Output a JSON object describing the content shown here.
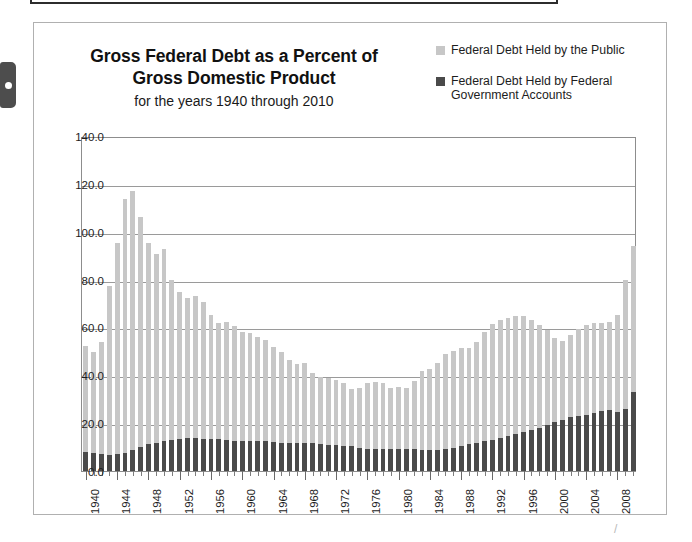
{
  "card": {
    "title_line1": "Gross  Federal Debt as a Percent of",
    "title_line2": "Gross Domestic Product",
    "subtitle": "for the years 1940 through 2010"
  },
  "legend": {
    "position": "top-right",
    "items": [
      {
        "label": "Federal Debt Held by the Public",
        "color": "#c7c7c7"
      },
      {
        "label": "Federal Debt Held by Federal Government Accounts",
        "color": "#4a4a4a"
      }
    ]
  },
  "colors": {
    "public": "#c7c7c7",
    "intragov": "#4a4a4a",
    "gridline": "#9a9a9a",
    "frame": "#8d8d8d",
    "card_border": "#b0b0b0",
    "text": "#1d1d1d"
  },
  "chart_data": {
    "type": "bar",
    "stacked": true,
    "title": "Gross  Federal Debt as a Percent of Gross Domestic Product",
    "subtitle": "for the years 1940 through 2010",
    "xlabel": "",
    "ylabel": "",
    "ylim": [
      0.0,
      140.0
    ],
    "ytick_values": [
      0.0,
      20.0,
      40.0,
      60.0,
      80.0,
      100.0,
      120.0,
      140.0
    ],
    "ytick_labels": [
      "0.0",
      "20.0",
      "40.0",
      "60.0",
      "80.0",
      "100.0",
      "120.0",
      "140.0"
    ],
    "grid": true,
    "legend_position": "top-right",
    "x_label_interval": 4,
    "categories": [
      1940,
      1941,
      1942,
      1943,
      1944,
      1945,
      1946,
      1947,
      1948,
      1949,
      1950,
      1951,
      1952,
      1953,
      1954,
      1955,
      1956,
      1957,
      1958,
      1959,
      1960,
      1961,
      1962,
      1963,
      1964,
      1965,
      1966,
      1967,
      1968,
      1969,
      1970,
      1971,
      1972,
      1973,
      1974,
      1975,
      1976,
      1977,
      1978,
      1979,
      1980,
      1981,
      1982,
      1983,
      1984,
      1985,
      1986,
      1987,
      1988,
      1989,
      1990,
      1991,
      1992,
      1993,
      1994,
      1995,
      1996,
      1997,
      1998,
      1999,
      2000,
      2001,
      2002,
      2003,
      2004,
      2005,
      2006,
      2007,
      2008,
      2009,
      2010
    ],
    "xtick_labels_shown": [
      "1940",
      "1944",
      "1948",
      "1952",
      "1956",
      "1960",
      "1964",
      "1968",
      "1972",
      "1976",
      "1980",
      "1984",
      "1988",
      "1992",
      "1996",
      "2000",
      "2004",
      "2008"
    ],
    "series": [
      {
        "name": "Federal Debt Held by Federal Government Accounts",
        "color": "#4a4a4a",
        "values": [
          8.0,
          7.6,
          7.0,
          6.6,
          7.2,
          7.4,
          8.6,
          9.9,
          11.2,
          11.9,
          12.7,
          12.9,
          13.4,
          13.7,
          13.8,
          13.3,
          13.4,
          13.3,
          12.9,
          12.6,
          12.7,
          12.6,
          12.4,
          12.4,
          12.0,
          11.6,
          11.6,
          11.9,
          11.7,
          11.6,
          11.3,
          10.9,
          10.7,
          10.6,
          10.4,
          9.6,
          9.2,
          9.2,
          9.2,
          9.2,
          9.2,
          9.1,
          9.0,
          8.7,
          8.6,
          8.9,
          9.2,
          9.7,
          10.4,
          11.1,
          11.8,
          12.5,
          13.1,
          13.8,
          14.6,
          15.5,
          16.3,
          17.0,
          18.1,
          19.3,
          20.6,
          21.5,
          22.4,
          23.0,
          23.6,
          24.4,
          25.1,
          25.5,
          24.5,
          25.8,
          32.9
        ]
      },
      {
        "name": "Federal Debt Held by the Public",
        "color": "#c7c7c7",
        "values": [
          44.2,
          42.3,
          47.1,
          70.9,
          88.3,
          106.2,
          108.6,
          96.2,
          84.3,
          79.0,
          80.2,
          66.9,
          61.6,
          58.6,
          59.5,
          57.2,
          52.0,
          48.7,
          49.2,
          47.9,
          45.6,
          45.0,
          43.7,
          42.4,
          40.0,
          38.0,
          34.9,
          32.9,
          33.3,
          29.3,
          28.0,
          28.1,
          27.4,
          26.0,
          23.9,
          25.3,
          27.5,
          27.8,
          27.4,
          25.6,
          26.1,
          25.8,
          28.6,
          33.1,
          34.0,
          36.4,
          39.6,
          40.6,
          40.9,
          40.5,
          42.1,
          45.4,
          48.2,
          49.4,
          49.3,
          49.2,
          48.5,
          46.1,
          43.1,
          39.8,
          35.1,
          33.0,
          34.5,
          36.2,
          37.3,
          37.5,
          36.9,
          36.7,
          40.5,
          54.1,
          61.3
        ]
      }
    ],
    "totals": [
      52.2,
      49.9,
      54.1,
      77.5,
      95.5,
      113.6,
      117.2,
      106.1,
      95.5,
      90.9,
      92.9,
      79.8,
      75.0,
      72.3,
      73.3,
      70.5,
      65.4,
      62.0,
      62.1,
      60.5,
      58.3,
      57.6,
      56.1,
      54.8,
      52.0,
      49.6,
      46.5,
      44.8,
      45.0,
      40.9,
      39.3,
      39.0,
      38.1,
      36.6,
      34.3,
      34.9,
      36.7,
      37.0,
      36.6,
      34.8,
      35.3,
      34.9,
      37.6,
      41.8,
      42.6,
      45.3,
      48.8,
      50.3,
      51.3,
      51.6,
      53.9,
      57.9,
      61.3,
      63.2,
      63.9,
      64.7,
      64.8,
      63.1,
      61.2,
      59.1,
      55.7,
      54.5,
      56.9,
      59.2,
      60.9,
      61.9,
      62.0,
      62.2,
      65.0,
      79.9,
      94.2
    ]
  }
}
